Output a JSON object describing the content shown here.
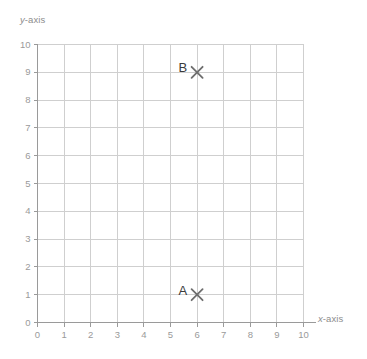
{
  "figure": {
    "background_color": "#ffffff",
    "grid_color": "#cfcfcf",
    "axis_color": "#9a9a9a",
    "tick_label_color": "#9a9a9a",
    "marker_color": "#6e6e6e",
    "point_label_color": "#3b3b3b"
  },
  "axes": {
    "x": {
      "label_var": "x",
      "label_suffix": "-axis",
      "label_full": "x-axis",
      "ticks": [
        "0",
        "1",
        "2",
        "3",
        "4",
        "5",
        "6",
        "7",
        "8",
        "9",
        "10"
      ]
    },
    "y": {
      "label_var": "y",
      "label_suffix": "-axis",
      "label_full": "y-axis",
      "ticks": [
        "0",
        "1",
        "2",
        "3",
        "4",
        "5",
        "6",
        "7",
        "8",
        "9",
        "10"
      ]
    }
  },
  "chart_data": {
    "type": "scatter",
    "title": "",
    "xlabel": "x-axis",
    "ylabel": "y-axis",
    "xlim": [
      0,
      10
    ],
    "ylim": [
      0,
      10
    ],
    "xticks": [
      0,
      1,
      2,
      3,
      4,
      5,
      6,
      7,
      8,
      9,
      10
    ],
    "yticks": [
      0,
      1,
      2,
      3,
      4,
      5,
      6,
      7,
      8,
      9,
      10
    ],
    "grid": true,
    "legend": false,
    "marker": "x",
    "points": [
      {
        "label": "A",
        "x": 6,
        "y": 1,
        "label_position": "left"
      },
      {
        "label": "B",
        "x": 6,
        "y": 9,
        "label_position": "left"
      }
    ]
  }
}
